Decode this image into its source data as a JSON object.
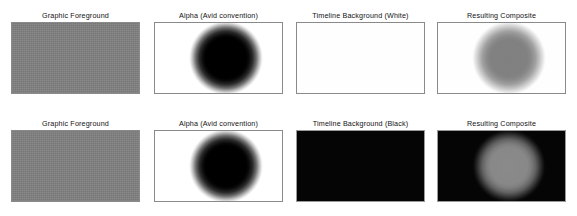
{
  "figure": {
    "background_color": "#ffffff",
    "rows": [
      {
        "row_name": "white-timeline-row",
        "panels": [
          {
            "caption": "Graphic Foreground",
            "surface": "gray",
            "fill_color": "#808080",
            "blob": "none"
          },
          {
            "caption": "Alpha (Avid convention)",
            "surface": "white",
            "fill_color": "#ffffff",
            "blob": "black-soft",
            "blob_color": "#000000"
          },
          {
            "caption": "Timeline Background (White)",
            "surface": "white",
            "fill_color": "#ffffff",
            "blob": "none"
          },
          {
            "caption": "Resulting Composite",
            "surface": "white",
            "fill_color": "#ffffff",
            "blob": "gray-soft-on-white",
            "blob_color": "#808080"
          }
        ]
      },
      {
        "row_name": "black-timeline-row",
        "panels": [
          {
            "caption": "Graphic Foreground",
            "surface": "gray",
            "fill_color": "#808080",
            "blob": "none"
          },
          {
            "caption": "Alpha (Avid convention)",
            "surface": "white",
            "fill_color": "#ffffff",
            "blob": "black-soft",
            "blob_color": "#000000"
          },
          {
            "caption": "Timeline Background (Black)",
            "surface": "black",
            "fill_color": "#050505",
            "blob": "none"
          },
          {
            "caption": "Resulting Composite",
            "surface": "black",
            "fill_color": "#050505",
            "blob": "gray-soft-on-black",
            "blob_color": "#8a8a8a"
          }
        ]
      }
    ]
  }
}
